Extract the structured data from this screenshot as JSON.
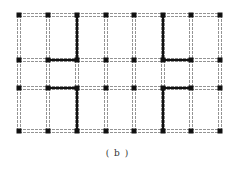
{
  "caption": "( b )",
  "grid": {
    "columns_x": [
      19,
      48,
      77,
      106,
      134,
      163,
      191,
      220
    ],
    "rows_y": [
      15,
      60,
      88,
      131
    ],
    "node_size": 5,
    "colors": {
      "node": "#111111",
      "bold_member": "#111111",
      "dashed_member": "#777777"
    }
  },
  "bold_members": [
    {
      "from": [
        2,
        0
      ],
      "to": [
        2,
        1
      ]
    },
    {
      "from": [
        1,
        1
      ],
      "to": [
        2,
        1
      ]
    },
    {
      "from": [
        1,
        2
      ],
      "to": [
        2,
        2
      ]
    },
    {
      "from": [
        2,
        2
      ],
      "to": [
        2,
        3
      ]
    },
    {
      "from": [
        5,
        0
      ],
      "to": [
        5,
        1
      ]
    },
    {
      "from": [
        5,
        1
      ],
      "to": [
        6,
        1
      ]
    },
    {
      "from": [
        5,
        2
      ],
      "to": [
        6,
        2
      ]
    },
    {
      "from": [
        5,
        2
      ],
      "to": [
        5,
        3
      ]
    }
  ]
}
